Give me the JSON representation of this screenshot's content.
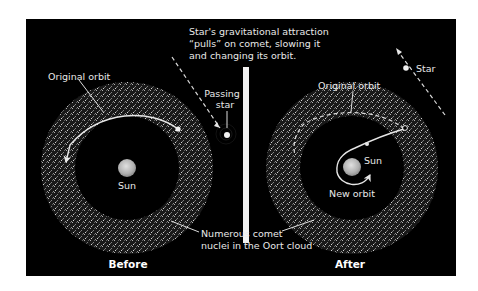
{
  "caption": {
    "line1": "Star's gravitational attraction",
    "line2": "“pulls” on comet, slowing it",
    "line3": "and changing its orbit."
  },
  "before": {
    "panel_label": "Before",
    "original_orbit_label": "Original orbit",
    "passing_star_line1": "Passing",
    "passing_star_line2": "star",
    "sun_label": "Sun"
  },
  "after": {
    "panel_label": "After",
    "original_orbit_label": "Original orbit",
    "star_label": "Star",
    "sun_label": "Sun",
    "new_orbit_label": "New orbit"
  },
  "oort_label": {
    "line1": "Numerous comet",
    "line2": "nuclei in the Oort cloud"
  },
  "colors": {
    "background": "#000000",
    "page": "#ffffff",
    "foreground": "#e8e8e8",
    "sun": "#bdbdbd",
    "divider": "#f2f2f2"
  }
}
